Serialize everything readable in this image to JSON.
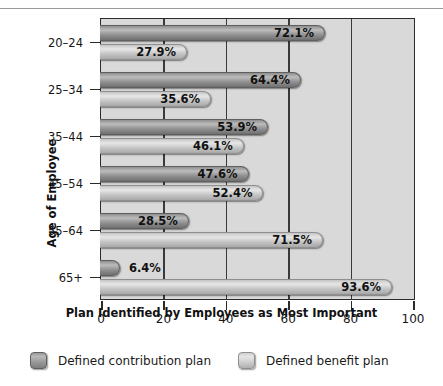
{
  "chart_data": {
    "type": "bar",
    "orientation": "horizontal",
    "title": "",
    "xlabel": "Plan Identified by Employees as Most Important",
    "ylabel": "Age of Employee",
    "categories": [
      "20–24",
      "25–34",
      "35–44",
      "45–54",
      "55–64",
      "65+"
    ],
    "xlim": [
      0,
      100
    ],
    "xticks": [
      0,
      20,
      40,
      60,
      80,
      100
    ],
    "xtick_labels": [
      "0",
      "20",
      "40",
      "60",
      "80",
      "100"
    ],
    "grid": "vertical",
    "legend_position": "bottom",
    "series": [
      {
        "name": "Defined contribution plan",
        "color": "#9a9a9a",
        "values": [
          72.1,
          64.4,
          53.9,
          47.6,
          28.5,
          6.4
        ],
        "value_labels": [
          "72.1%",
          "64.4%",
          "53.9%",
          "47.6%",
          "28.5%",
          "6.4%"
        ]
      },
      {
        "name": "Defined benefit plan",
        "color": "#d4d4d4",
        "values": [
          27.9,
          35.6,
          46.1,
          52.4,
          71.5,
          93.6
        ],
        "value_labels": [
          "27.9%",
          "35.6%",
          "46.1%",
          "52.4%",
          "71.5%",
          "93.6%"
        ]
      }
    ]
  },
  "legend": {
    "items": [
      {
        "label": "Defined contribution plan",
        "swatch": "dc"
      },
      {
        "label": "Defined benefit plan",
        "swatch": "db"
      }
    ]
  },
  "axis": {
    "x_title": "Plan Identified by Employees as Most Important",
    "y_title": "Age of Employee"
  },
  "top_caption_fragment": ""
}
